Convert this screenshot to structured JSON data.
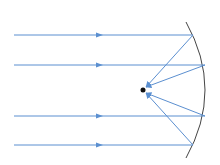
{
  "diagram": {
    "colors": {
      "ray": "#5b8fd0",
      "mirror": "#444444",
      "focus": "#111111"
    },
    "incident_rays": [
      {
        "id": "ray-1",
        "label": "incident ray 1"
      },
      {
        "id": "ray-2",
        "label": "incident ray 2"
      },
      {
        "id": "ray-3",
        "label": "incident ray 3"
      },
      {
        "id": "ray-4",
        "label": "incident ray 4"
      }
    ],
    "focal_point": {
      "label": "focal point"
    },
    "mirror": {
      "label": "concave mirror"
    }
  }
}
